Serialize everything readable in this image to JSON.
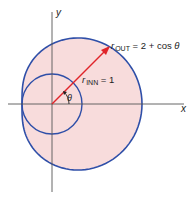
{
  "diagram": {
    "axes": {
      "x_label": "x",
      "y_label": "y"
    },
    "outer_curve": {
      "label_r": "r",
      "label_sub": "OUT",
      "label_eq": " = 2 + cos ",
      "label_theta": "θ",
      "equation": "r_OUT = 2 + cos θ"
    },
    "inner_circle": {
      "label_r": "r",
      "label_sub": "INN",
      "label_eq": " = 1",
      "equation": "r_INN = 1"
    },
    "angle": {
      "label": "θ"
    },
    "colors": {
      "curve": "#2f4fa8",
      "fill": "#f8dcdc",
      "ray": "#e0242a",
      "axes": "#555555"
    }
  }
}
